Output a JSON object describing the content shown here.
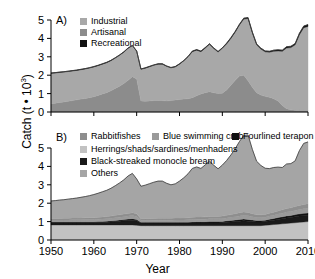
{
  "axes": {
    "ylabel_main": "Catch (t",
    "ylabel_mult": " • 10",
    "ylabel_exp": "3",
    "ylabel_close": ")",
    "xlabel": "Year",
    "yticks": [
      "0",
      "1",
      "2",
      "3",
      "4",
      "5"
    ],
    "xticks": [
      "1950",
      "1960",
      "1970",
      "1980",
      "1990",
      "2000",
      "2010"
    ]
  },
  "panelA": {
    "tag": "A)",
    "legend": [
      {
        "label": "Industrial",
        "color": "#a8a8a8"
      },
      {
        "label": "Artisanal",
        "color": "#8c8c8c"
      },
      {
        "label": "Recreational",
        "color": "#111111"
      }
    ]
  },
  "panelB": {
    "tag": "B)",
    "legend": [
      {
        "label": "Rabbitfishes",
        "color": "#8e8e8e"
      },
      {
        "label": "Blue swimming crab",
        "color": "#9a9a9a"
      },
      {
        "label": "Fourlined terapon",
        "color": "#111111"
      },
      {
        "label": "Herrings/shads/sardines/menhadens",
        "color": "#c2c2c2"
      },
      {
        "label": "Black-streaked monocle bream",
        "color": "#1a1a1a"
      },
      {
        "label": "Others",
        "color": "#a5a5a5"
      }
    ]
  },
  "chart_data": {
    "type": "area",
    "title": "",
    "xlabel": "Year",
    "ylabel": "Catch (t • 10^3)",
    "xlim": [
      1950,
      2010
    ],
    "ylim": [
      0,
      5
    ],
    "grid": false,
    "panels": [
      {
        "id": "A",
        "label": "A)",
        "stacking": "stacked",
        "legend_position": "top-left",
        "x": [
          1950,
          1951,
          1952,
          1953,
          1954,
          1955,
          1956,
          1957,
          1958,
          1959,
          1960,
          1961,
          1962,
          1963,
          1964,
          1965,
          1966,
          1967,
          1968,
          1969,
          1970,
          1971,
          1972,
          1973,
          1974,
          1975,
          1976,
          1977,
          1978,
          1979,
          1980,
          1981,
          1982,
          1983,
          1984,
          1985,
          1986,
          1987,
          1988,
          1989,
          1990,
          1991,
          1992,
          1993,
          1994,
          1995,
          1996,
          1997,
          1998,
          1999,
          2000,
          2001,
          2002,
          2003,
          2004,
          2005,
          2006,
          2007,
          2008,
          2009,
          2010
        ],
        "series": [
          {
            "name": "Artisanal",
            "color": "#8c8c8c",
            "values": [
              0.45,
              0.48,
              0.52,
              0.55,
              0.58,
              0.62,
              0.66,
              0.7,
              0.74,
              0.78,
              0.83,
              0.9,
              0.98,
              1.05,
              1.15,
              1.28,
              1.4,
              1.55,
              1.72,
              1.92,
              1.8,
              0.6,
              0.58,
              0.6,
              0.62,
              0.63,
              0.62,
              0.6,
              0.62,
              0.65,
              0.68,
              0.7,
              0.72,
              0.78,
              0.88,
              0.98,
              1.05,
              1.1,
              1.05,
              1.0,
              1.02,
              1.2,
              1.45,
              1.72,
              1.95,
              2.0,
              1.7,
              1.35,
              1.05,
              0.92,
              0.85,
              0.8,
              0.72,
              0.6,
              0.35,
              0.18,
              0.12,
              0.1,
              0.1,
              0.1,
              0.1
            ]
          },
          {
            "name": "Industrial",
            "color": "#a8a8a8",
            "values": [
              1.65,
              1.64,
              1.63,
              1.62,
              1.62,
              1.61,
              1.6,
              1.6,
              1.6,
              1.61,
              1.62,
              1.62,
              1.62,
              1.63,
              1.64,
              1.65,
              1.68,
              1.7,
              1.74,
              1.68,
              1.5,
              1.72,
              1.8,
              1.86,
              1.92,
              1.97,
              1.98,
              1.88,
              1.78,
              1.8,
              1.92,
              2.08,
              2.28,
              2.5,
              2.48,
              2.3,
              2.42,
              2.58,
              2.4,
              2.26,
              2.44,
              2.5,
              2.55,
              2.62,
              2.78,
              3.05,
              3.38,
              2.95,
              2.6,
              2.5,
              2.42,
              2.45,
              2.58,
              2.72,
              2.95,
              3.3,
              3.38,
              3.55,
              4.1,
              4.48,
              4.55
            ]
          },
          {
            "name": "Recreational",
            "color": "#111111",
            "values": [
              0.02,
              0.02,
              0.02,
              0.02,
              0.02,
              0.02,
              0.02,
              0.02,
              0.02,
              0.02,
              0.02,
              0.02,
              0.02,
              0.02,
              0.02,
              0.02,
              0.02,
              0.02,
              0.02,
              0.02,
              0.02,
              0.02,
              0.02,
              0.02,
              0.02,
              0.02,
              0.02,
              0.02,
              0.02,
              0.02,
              0.02,
              0.02,
              0.02,
              0.03,
              0.03,
              0.03,
              0.03,
              0.03,
              0.03,
              0.03,
              0.03,
              0.04,
              0.04,
              0.04,
              0.04,
              0.05,
              0.05,
              0.05,
              0.05,
              0.05,
              0.05,
              0.05,
              0.06,
              0.06,
              0.06,
              0.07,
              0.07,
              0.07,
              0.08,
              0.09,
              0.1
            ]
          }
        ],
        "totals": [
          2.12,
          2.14,
          2.17,
          2.19,
          2.22,
          2.25,
          2.28,
          2.32,
          2.36,
          2.41,
          2.47,
          2.54,
          2.62,
          2.7,
          2.81,
          2.95,
          3.1,
          3.27,
          3.48,
          3.62,
          3.32,
          2.34,
          2.4,
          2.48,
          2.56,
          2.62,
          2.62,
          2.5,
          2.42,
          2.47,
          2.62,
          2.8,
          3.02,
          3.31,
          3.39,
          3.31,
          3.5,
          3.71,
          3.48,
          3.29,
          3.49,
          3.74,
          4.04,
          4.38,
          4.77,
          5.1,
          5.13,
          4.35,
          3.7,
          3.47,
          3.32,
          3.3,
          3.36,
          3.38,
          3.36,
          3.55,
          3.57,
          3.72,
          4.28,
          4.67,
          4.75
        ]
      },
      {
        "id": "B",
        "label": "B)",
        "stacking": "stacked",
        "legend_position": "top-left",
        "x": [
          1950,
          1951,
          1952,
          1953,
          1954,
          1955,
          1956,
          1957,
          1958,
          1959,
          1960,
          1961,
          1962,
          1963,
          1964,
          1965,
          1966,
          1967,
          1968,
          1969,
          1970,
          1971,
          1972,
          1973,
          1974,
          1975,
          1976,
          1977,
          1978,
          1979,
          1980,
          1981,
          1982,
          1983,
          1984,
          1985,
          1986,
          1987,
          1988,
          1989,
          1990,
          1991,
          1992,
          1993,
          1994,
          1995,
          1996,
          1997,
          1998,
          1999,
          2000,
          2001,
          2002,
          2003,
          2004,
          2005,
          2006,
          2007,
          2008,
          2009,
          2010
        ],
        "series": [
          {
            "name": "Herrings/shads/sardines/menhadens",
            "color": "#c2c2c2",
            "values": [
              0.82,
              0.82,
              0.82,
              0.82,
              0.82,
              0.82,
              0.82,
              0.82,
              0.82,
              0.82,
              0.82,
              0.82,
              0.82,
              0.82,
              0.82,
              0.82,
              0.82,
              0.82,
              0.82,
              0.82,
              0.8,
              0.78,
              0.78,
              0.78,
              0.78,
              0.78,
              0.78,
              0.78,
              0.78,
              0.78,
              0.78,
              0.78,
              0.78,
              0.78,
              0.78,
              0.78,
              0.78,
              0.78,
              0.78,
              0.78,
              0.78,
              0.78,
              0.78,
              0.78,
              0.78,
              0.78,
              0.78,
              0.78,
              0.78,
              0.78,
              0.8,
              0.82,
              0.84,
              0.86,
              0.88,
              0.9,
              0.92,
              0.94,
              0.96,
              0.98,
              1.0
            ]
          },
          {
            "name": "Black-streaked monocle bream",
            "color": "#1a1a1a",
            "values": [
              0.12,
              0.12,
              0.12,
              0.12,
              0.12,
              0.12,
              0.12,
              0.12,
              0.12,
              0.12,
              0.12,
              0.13,
              0.14,
              0.15,
              0.16,
              0.18,
              0.2,
              0.22,
              0.24,
              0.26,
              0.24,
              0.14,
              0.14,
              0.14,
              0.14,
              0.14,
              0.14,
              0.14,
              0.14,
              0.14,
              0.14,
              0.14,
              0.14,
              0.14,
              0.15,
              0.15,
              0.15,
              0.15,
              0.15,
              0.15,
              0.16,
              0.18,
              0.2,
              0.22,
              0.24,
              0.26,
              0.24,
              0.22,
              0.2,
              0.2,
              0.2,
              0.22,
              0.24,
              0.26,
              0.28,
              0.3,
              0.3,
              0.32,
              0.34,
              0.34,
              0.34
            ]
          },
          {
            "name": "Fourlined terapon",
            "color": "#111111",
            "values": [
              0.05,
              0.05,
              0.05,
              0.05,
              0.05,
              0.05,
              0.05,
              0.05,
              0.05,
              0.05,
              0.05,
              0.05,
              0.05,
              0.05,
              0.06,
              0.06,
              0.07,
              0.07,
              0.08,
              0.08,
              0.08,
              0.05,
              0.05,
              0.05,
              0.05,
              0.05,
              0.05,
              0.05,
              0.05,
              0.05,
              0.05,
              0.05,
              0.05,
              0.06,
              0.06,
              0.06,
              0.06,
              0.07,
              0.07,
              0.07,
              0.07,
              0.08,
              0.08,
              0.09,
              0.1,
              0.1,
              0.1,
              0.09,
              0.08,
              0.08,
              0.08,
              0.09,
              0.09,
              0.1,
              0.1,
              0.11,
              0.11,
              0.12,
              0.12,
              0.13,
              0.13
            ]
          },
          {
            "name": "Blue swimming crab",
            "color": "#9a9a9a",
            "values": [
              0.1,
              0.1,
              0.1,
              0.1,
              0.1,
              0.11,
              0.11,
              0.11,
              0.12,
              0.12,
              0.12,
              0.13,
              0.13,
              0.14,
              0.14,
              0.15,
              0.15,
              0.16,
              0.16,
              0.17,
              0.16,
              0.1,
              0.1,
              0.1,
              0.11,
              0.11,
              0.11,
              0.11,
              0.11,
              0.12,
              0.12,
              0.12,
              0.13,
              0.13,
              0.14,
              0.14,
              0.14,
              0.15,
              0.15,
              0.15,
              0.15,
              0.16,
              0.17,
              0.18,
              0.19,
              0.2,
              0.2,
              0.18,
              0.16,
              0.16,
              0.16,
              0.17,
              0.18,
              0.19,
              0.2,
              0.21,
              0.22,
              0.23,
              0.24,
              0.25,
              0.26
            ]
          },
          {
            "name": "Rabbitfishes",
            "color": "#8e8e8e",
            "values": [
              0.08,
              0.08,
              0.08,
              0.09,
              0.09,
              0.09,
              0.09,
              0.1,
              0.1,
              0.1,
              0.1,
              0.11,
              0.11,
              0.12,
              0.12,
              0.13,
              0.13,
              0.14,
              0.14,
              0.15,
              0.14,
              0.09,
              0.09,
              0.09,
              0.09,
              0.1,
              0.1,
              0.1,
              0.1,
              0.1,
              0.1,
              0.11,
              0.11,
              0.12,
              0.12,
              0.12,
              0.13,
              0.13,
              0.13,
              0.13,
              0.14,
              0.14,
              0.15,
              0.16,
              0.17,
              0.18,
              0.18,
              0.16,
              0.15,
              0.15,
              0.15,
              0.15,
              0.16,
              0.17,
              0.18,
              0.19,
              0.2,
              0.21,
              0.22,
              0.23,
              0.24
            ]
          },
          {
            "name": "Others",
            "color": "#a5a5a5",
            "values": [
              0.95,
              0.97,
              1.0,
              1.01,
              1.04,
              1.06,
              1.09,
              1.12,
              1.15,
              1.2,
              1.26,
              1.3,
              1.37,
              1.42,
              1.51,
              1.61,
              1.73,
              1.86,
              2.04,
              2.14,
              1.9,
              1.76,
              1.82,
              1.9,
              1.97,
              2.02,
              2.02,
              1.9,
              1.82,
              1.86,
              2.01,
              2.18,
              2.39,
              2.66,
              2.72,
              2.64,
              2.82,
              3.01,
              2.78,
              2.59,
              2.77,
              2.98,
              3.24,
              3.53,
              3.87,
              4.16,
              4.21,
              3.5,
              2.91,
              2.68,
              2.51,
              2.43,
              2.43,
              2.38,
              2.3,
              2.42,
              2.4,
              2.48,
              2.98,
              3.32,
              3.36
            ]
          }
        ],
        "totals": [
          2.12,
          2.14,
          2.17,
          2.19,
          2.22,
          2.25,
          2.28,
          2.32,
          2.36,
          2.41,
          2.47,
          2.54,
          2.62,
          2.7,
          2.81,
          2.95,
          3.1,
          3.27,
          3.48,
          3.62,
          3.32,
          2.92,
          2.98,
          3.06,
          3.14,
          3.2,
          3.2,
          3.08,
          3.0,
          3.05,
          3.2,
          3.38,
          3.6,
          3.89,
          3.97,
          3.89,
          4.08,
          4.29,
          4.06,
          3.87,
          4.07,
          4.32,
          4.62,
          4.96,
          5.35,
          5.68,
          5.71,
          4.93,
          4.28,
          4.05,
          3.9,
          3.88,
          3.94,
          3.96,
          3.94,
          4.13,
          4.15,
          4.3,
          4.86,
          5.25,
          5.33
        ]
      }
    ]
  }
}
